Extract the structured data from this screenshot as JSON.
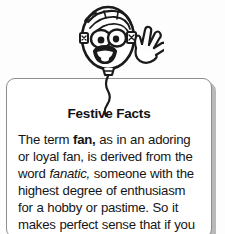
{
  "page": {
    "background_color": "#fdfdfd",
    "width": 225,
    "height": 234
  },
  "mascot": {
    "name": "balloon-character",
    "description": "cartoon smiling balloon with face and waving hand",
    "line_color": "#1a1a1a",
    "fill_color": "#ffffff"
  },
  "card": {
    "title": "Festive Facts",
    "border_color": "#8d8d8d",
    "shadow_color": "#b9b9b9",
    "background_color": "#ffffff",
    "body": {
      "segment_1": "The term ",
      "bold_1": "fan,",
      "segment_2": " as in an adoring or loyal fan, is derived from the word ",
      "italic_1": "fanatic,",
      "segment_3": " someone with the highest degree of enthusiasm for a hobby or pastime. So it makes perfect sense that if you are a"
    }
  }
}
